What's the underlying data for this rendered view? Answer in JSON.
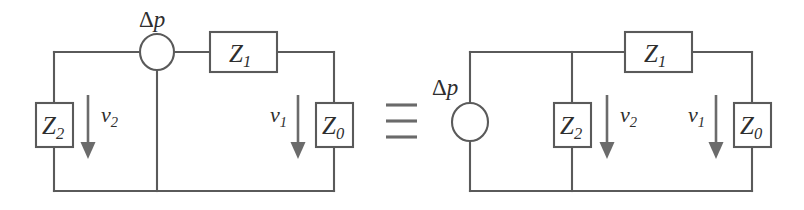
{
  "figure": {
    "relation_symbol": "identical-to",
    "ink_color": "#5a5a5a",
    "arrow_color": "#6b6b6b",
    "text_color": "#2e2e2e",
    "background": "#ffffff"
  },
  "circuits": [
    {
      "id": "left-circuit",
      "name": "series-source-circuit",
      "source": {
        "name": "pressure-source",
        "label_delta": "Δ",
        "label_var": "p",
        "orientation": "horizontal-inline-top"
      },
      "components": [
        {
          "name": "impedance-z2",
          "label_base": "Z",
          "label_sub": "2",
          "position": "left-branch"
        },
        {
          "name": "impedance-z1",
          "label_base": "Z",
          "label_sub": "1",
          "position": "top-series"
        },
        {
          "name": "impedance-z0",
          "label_base": "Z",
          "label_sub": "0",
          "position": "right-branch"
        }
      ],
      "flows": [
        {
          "name": "flow-v2",
          "label_base": "v",
          "label_sub": "2",
          "direction": "down"
        },
        {
          "name": "flow-v1",
          "label_base": "v",
          "label_sub": "1",
          "direction": "down"
        }
      ]
    },
    {
      "id": "right-circuit",
      "name": "parallel-source-circuit",
      "source": {
        "name": "pressure-source",
        "label_delta": "Δ",
        "label_var": "p",
        "orientation": "vertical-left-branch"
      },
      "components": [
        {
          "name": "impedance-z2",
          "label_base": "Z",
          "label_sub": "2",
          "position": "middle-branch"
        },
        {
          "name": "impedance-z1",
          "label_base": "Z",
          "label_sub": "1",
          "position": "top-series"
        },
        {
          "name": "impedance-z0",
          "label_base": "Z",
          "label_sub": "0",
          "position": "right-branch"
        }
      ],
      "flows": [
        {
          "name": "flow-v2",
          "label_base": "v",
          "label_sub": "2",
          "direction": "down"
        },
        {
          "name": "flow-v1",
          "label_base": "v",
          "label_sub": "1",
          "direction": "down"
        }
      ]
    }
  ],
  "labels": {
    "left": {
      "delta_p": {
        "delta": "Δ",
        "var": "p"
      },
      "z2": {
        "base": "Z",
        "sub": "2"
      },
      "z1": {
        "base": "Z",
        "sub": "1"
      },
      "z0": {
        "base": "Z",
        "sub": "0"
      },
      "v2": {
        "base": "v",
        "sub": "2"
      },
      "v1": {
        "base": "v",
        "sub": "1"
      }
    },
    "right": {
      "delta_p": {
        "delta": "Δ",
        "var": "p"
      },
      "z2": {
        "base": "Z",
        "sub": "2"
      },
      "z1": {
        "base": "Z",
        "sub": "1"
      },
      "z0": {
        "base": "Z",
        "sub": "0"
      },
      "v2": {
        "base": "v",
        "sub": "2"
      },
      "v1": {
        "base": "v",
        "sub": "1"
      }
    }
  }
}
